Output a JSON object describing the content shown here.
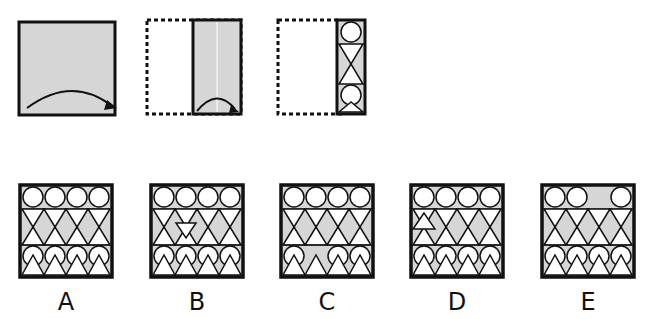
{
  "puzzle": {
    "type": "paper folding",
    "fill_color": "#d6d6d6",
    "stroke_color": "#111111",
    "steps": [
      {
        "id": "step-1",
        "description": "square sheet with fold arrow from left to right"
      },
      {
        "id": "step-2",
        "description": "sheet folded in half, dotted outline of original, second fold arrow"
      },
      {
        "id": "step-3",
        "description": "folded strip with cut-out pattern circle, bowtie triangles, circle, triangle"
      }
    ],
    "options": [
      {
        "label": "A",
        "description": "complete pattern: 4 circles, triangle rows, 4 circles, triangles"
      },
      {
        "label": "B",
        "description": "extra inverted triangle in middle row"
      },
      {
        "label": "C",
        "description": "second circle in lower row missing"
      },
      {
        "label": "D",
        "description": "small triangle added at left of triangle row"
      },
      {
        "label": "E",
        "description": "third circle in top row missing"
      }
    ]
  }
}
